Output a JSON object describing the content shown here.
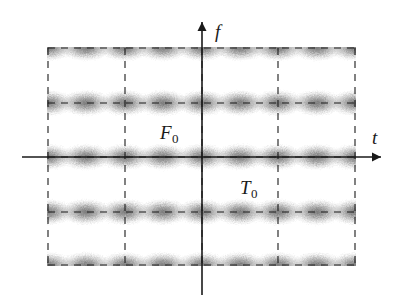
{
  "figure": {
    "background_color": "#ffffff",
    "ink_color": "#1a1a1a",
    "blob_color": "#555555"
  },
  "axes": {
    "horizontal": {
      "label": "t",
      "name": "time-axis",
      "x_start": 22,
      "x_end": 381,
      "y": 157,
      "arrow": "right"
    },
    "vertical": {
      "label": "f",
      "name": "frequency-axis",
      "x": 202,
      "y_start": 295,
      "y_end": 22,
      "arrow": "up"
    }
  },
  "labels": {
    "frequency_spacing": {
      "base": "F",
      "sub": "0",
      "x": 160,
      "y": 139
    },
    "time_spacing": {
      "base": "T",
      "sub": "0",
      "x": 240,
      "y": 194
    }
  },
  "grid": {
    "left": 48,
    "right": 355,
    "top": 48,
    "bottom": 265,
    "vertical_lines_x": [
      48,
      125,
      202,
      278,
      355
    ],
    "horizontal_lines_y": [
      48,
      103,
      157,
      212,
      265
    ],
    "dash_pattern": "7 6",
    "style": "dashed"
  },
  "chart_data": {
    "type": "scatter",
    "xlabel": "t",
    "ylabel": "f",
    "grid": true,
    "legend": false,
    "lattice": {
      "time_spacing_label": "T0",
      "frequency_spacing_label": "F0",
      "time_spacing_px": 77,
      "frequency_spacing_px": 54,
      "blob_columns_x": [
        48,
        86,
        125,
        163,
        202,
        240,
        278,
        317,
        355
      ],
      "blob_rows_y": [
        48,
        103,
        157,
        212,
        265
      ],
      "blob_radius_x": 26,
      "blob_radius_y": 13
    },
    "xlim": [
      22,
      381
    ],
    "ylim": [
      22,
      295
    ]
  }
}
